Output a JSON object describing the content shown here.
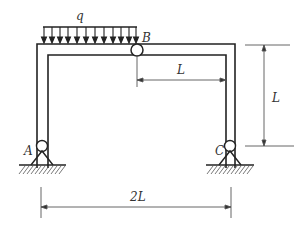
{
  "diagram": {
    "type": "portal frame with distributed load",
    "labels": {
      "load": "q",
      "hinge_top": "B",
      "support_left": "A",
      "support_right": "C",
      "dim_half_span": "L",
      "dim_height": "L",
      "dim_span": "2L"
    },
    "colors": {
      "line": "#222222",
      "dim_line": "#555555",
      "text": "#333333"
    }
  }
}
